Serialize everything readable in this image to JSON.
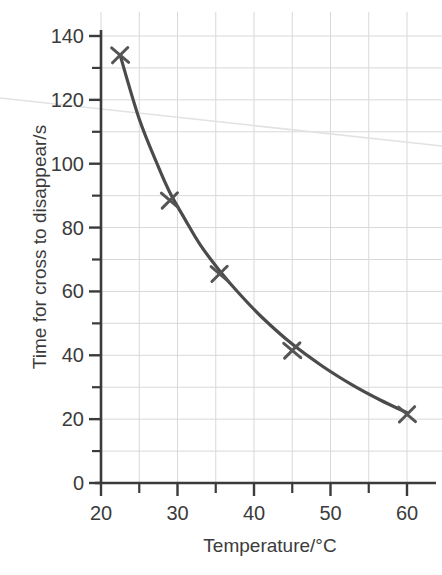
{
  "chart_data": {
    "type": "line",
    "title": "",
    "subtitle": "",
    "xlabel": "Temperature/°C",
    "ylabel": "Time for cross to disappear/s",
    "xlim": [
      20,
      62
    ],
    "ylim": [
      0,
      145
    ],
    "xticks": [
      20,
      30,
      40,
      50,
      60
    ],
    "xtick_labels": [
      "20",
      "30",
      "40",
      "50",
      "60"
    ],
    "x_minor_ticks": [
      25,
      35,
      45,
      55
    ],
    "yticks": [
      0,
      20,
      40,
      60,
      80,
      100,
      120,
      140
    ],
    "ytick_labels": [
      "0",
      "20",
      "40",
      "60",
      "80",
      "100",
      "120",
      "140"
    ],
    "y_minor_ticks": [
      10,
      30,
      50,
      70,
      90,
      110,
      130
    ],
    "grid": true,
    "grid_color": "#d8d8d8",
    "legend": null,
    "legend_position": "none",
    "marker": "x-cross",
    "marker_color": "#555555",
    "line_color": "#4b4b4b",
    "axis_color": "#3b3b3b",
    "series": [
      {
        "name": "Time for cross to disappear",
        "x": [
          22.5,
          29,
          35.5,
          45,
          60
        ],
        "values": [
          134,
          88.5,
          65.5,
          41.5,
          21.5
        ]
      }
    ],
    "fitted_curve": {
      "name": "best-fit smooth curve",
      "x": [
        22.5,
        25,
        27.5,
        29,
        31,
        33,
        35.5,
        38,
        41,
        45,
        49,
        53,
        56.5,
        60
      ],
      "y": [
        134,
        114,
        99,
        91,
        82.5,
        74.5,
        66.5,
        59.5,
        52,
        43.5,
        36.5,
        30.5,
        26,
        22
      ]
    },
    "annotations": [
      {
        "name": "scan-artifact-line",
        "type": "faint-diagonal-streak",
        "from": [
          0,
          98
        ],
        "to": [
          442,
          146
        ]
      }
    ]
  },
  "axes": {
    "x_axis_name": "temperature-axis",
    "y_axis_name": "time-axis"
  }
}
